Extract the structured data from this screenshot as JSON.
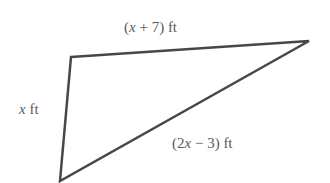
{
  "figure": {
    "type": "triangle",
    "stroke_color": "#474747",
    "text_color": "#5a5a5a",
    "vertices": {
      "top_left": [
        71,
        57
      ],
      "top_right": [
        309,
        41
      ],
      "bottom": [
        60,
        181
      ]
    },
    "sides": {
      "top": {
        "label": "(x + 7) ft",
        "pre": "(",
        "var": "x",
        "post": " + 7) ft"
      },
      "left": {
        "label": "x ft",
        "pre": "",
        "var": "x",
        "post": " ft"
      },
      "hypotenuse": {
        "label": "(2x − 3) ft",
        "pre": "(2",
        "var": "x",
        "post": " − 3) ft"
      }
    }
  }
}
